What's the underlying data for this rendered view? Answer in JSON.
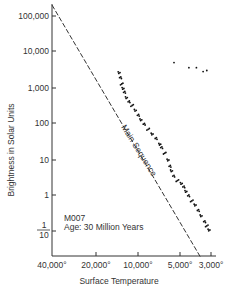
{
  "chart_data": {
    "type": "scatter",
    "title": "",
    "xlabel": "Surface Temperature",
    "ylabel": "Brightness in Solar Units",
    "x_scale": "log-reversed",
    "y_scale": "log",
    "xlim": [
      40000,
      3000
    ],
    "ylim": [
      0.05,
      200000
    ],
    "grid": false,
    "x_ticks": [
      {
        "value": 40000,
        "label": "40,000°"
      },
      {
        "value": 20000,
        "label": "20,000°"
      },
      {
        "value": 10000,
        "label": "10,000°"
      },
      {
        "value": 5000,
        "label": "5,000°"
      },
      {
        "value": 3000,
        "label": "3,000°"
      }
    ],
    "y_ticks": [
      {
        "value": 100000,
        "label": "100,000"
      },
      {
        "value": 10000,
        "label": "10,000"
      },
      {
        "value": 1000,
        "label": "1,000"
      },
      {
        "value": 100,
        "label": "100"
      },
      {
        "value": 10,
        "label": "10"
      },
      {
        "value": 1,
        "label": "1"
      },
      {
        "value": 0.1,
        "label_num": "1",
        "label_den": "10"
      }
    ],
    "annotations": [
      {
        "text": "Main Sequence",
        "rotation": 58
      },
      {
        "text": "M007"
      },
      {
        "text": "Age:  30 Million Years"
      }
    ],
    "series": [
      {
        "name": "Main Sequence (reference line)",
        "style": "dashed",
        "points": [
          [
            40000,
            200000
          ],
          [
            3000,
            0.05
          ]
        ]
      },
      {
        "name": "Cluster stars (main sequence)",
        "style": "dots",
        "points": [
          [
            13500,
            2500
          ],
          [
            13200,
            1800
          ],
          [
            13000,
            1200
          ],
          [
            12800,
            900
          ],
          [
            12500,
            700
          ],
          [
            12000,
            500
          ],
          [
            11500,
            380
          ],
          [
            11000,
            300
          ],
          [
            10500,
            220
          ],
          [
            10000,
            160
          ],
          [
            9500,
            120
          ],
          [
            9000,
            90
          ],
          [
            8500,
            65
          ],
          [
            8000,
            48
          ],
          [
            7500,
            36
          ],
          [
            7000,
            25
          ],
          [
            6800,
            20
          ],
          [
            6500,
            14
          ],
          [
            6200,
            9
          ],
          [
            6000,
            6
          ],
          [
            5800,
            4.5
          ],
          [
            5600,
            3.2
          ],
          [
            5300,
            2.4
          ],
          [
            5000,
            2
          ],
          [
            4800,
            1.6
          ],
          [
            4600,
            1.2
          ],
          [
            4400,
            0.9
          ],
          [
            4200,
            0.65
          ],
          [
            4000,
            0.5
          ],
          [
            3800,
            0.35
          ],
          [
            3600,
            0.25
          ],
          [
            3400,
            0.17
          ],
          [
            3300,
            0.13
          ],
          [
            3200,
            0.1
          ]
        ]
      },
      {
        "name": "Red giants",
        "style": "dots",
        "points": [
          [
            5600,
            5000
          ],
          [
            4400,
            3600
          ],
          [
            3900,
            3600
          ],
          [
            3500,
            2800
          ],
          [
            3300,
            3000
          ]
        ]
      }
    ]
  }
}
